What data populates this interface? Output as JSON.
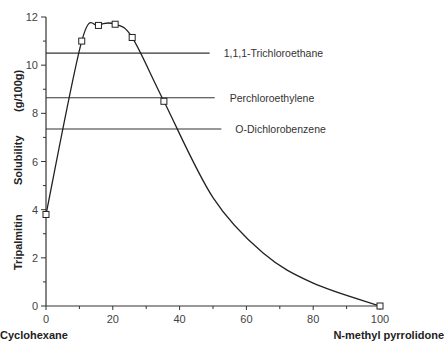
{
  "chart_data": {
    "type": "line",
    "title": "",
    "xlabel_left": "Cyclohexane",
    "xlabel_right": "N-methyl pyrrolidone",
    "ylabel": "Tripalmitin Solubility (g/100g)",
    "ylabel_parts": [
      "Tripalmitin",
      "Solubility",
      "(g/100g)"
    ],
    "xlim": [
      0,
      100
    ],
    "ylim": [
      0,
      12
    ],
    "x_ticks": [
      "0",
      "20",
      "40",
      "60",
      "80",
      "100"
    ],
    "y_ticks": [
      "0",
      "2",
      "4",
      "6",
      "8",
      "10",
      "12"
    ],
    "grid": false,
    "series": [
      {
        "name": "Cyclohexane / N-methyl pyrrolidone mixture",
        "marker": "square",
        "x": [
          0,
          10.7,
          15.7,
          20.7,
          25.8,
          35.3,
          100
        ],
        "y": [
          3.8,
          11.0,
          11.65,
          11.7,
          11.15,
          8.5,
          0.0
        ]
      }
    ],
    "reference_lines": [
      {
        "label": "1,1,1-Trichloroethane",
        "y": 10.5,
        "x_end": 49
      },
      {
        "label": "Perchloroethylene",
        "y": 8.65,
        "x_end": 50.5
      },
      {
        "label": "O-Dichlorobenzene",
        "y": 7.35,
        "x_end": 52.5
      }
    ]
  }
}
